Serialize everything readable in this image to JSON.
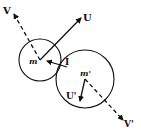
{
  "diagram": {
    "type": "collision-vector-diagram",
    "colors": {
      "ink": "#111111",
      "background": "#ffffff"
    },
    "bodies": [
      {
        "id": "m",
        "label": "m",
        "cx": 40,
        "cy": 60,
        "r": 21
      },
      {
        "id": "m_prime",
        "label": "m'",
        "cx": 85,
        "cy": 79,
        "r": 29
      }
    ],
    "vectors": [
      {
        "id": "V",
        "label": "V",
        "style": "dashed",
        "from": [
          40,
          60
        ],
        "to": [
          14,
          14
        ]
      },
      {
        "id": "U",
        "label": "U",
        "style": "solid",
        "from": [
          40,
          60
        ],
        "to": [
          81,
          18
        ]
      },
      {
        "id": "I",
        "label": "I",
        "style": "solid",
        "from": [
          67,
          67
        ],
        "to": [
          47,
          61
        ]
      },
      {
        "id": "U_prime",
        "label": "U'",
        "style": "solid",
        "from": [
          85,
          79
        ],
        "to": [
          80,
          101
        ]
      },
      {
        "id": "V_prime",
        "label": "V'",
        "style": "dashed",
        "from": [
          85,
          79
        ],
        "to": [
          123,
          120
        ]
      }
    ],
    "labels": {
      "V": "V",
      "U": "U",
      "m": "m",
      "I": "I",
      "m_prime": "m'",
      "U_prime": "U'",
      "V_prime": "V'"
    }
  }
}
